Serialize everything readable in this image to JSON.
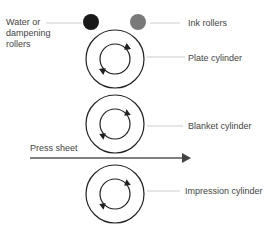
{
  "labels": {
    "water_rollers": "Water or\ndampening\nrollers",
    "water_rollers_lines": [
      "Water or",
      "dampening",
      "rollers"
    ],
    "ink_rollers": "Ink rollers",
    "plate_cylinder": "Plate cylinder",
    "blanket_cylinder": "Blanket cylinder",
    "press_sheet": "Press sheet",
    "impression_cylinder": "Impression cylinder"
  },
  "colors": {
    "water_roller": "#1a1a1a",
    "ink_roller": "#7a7a7a",
    "stroke": "#222222",
    "leader_line": "#cccccc",
    "arrow": "#555555"
  }
}
